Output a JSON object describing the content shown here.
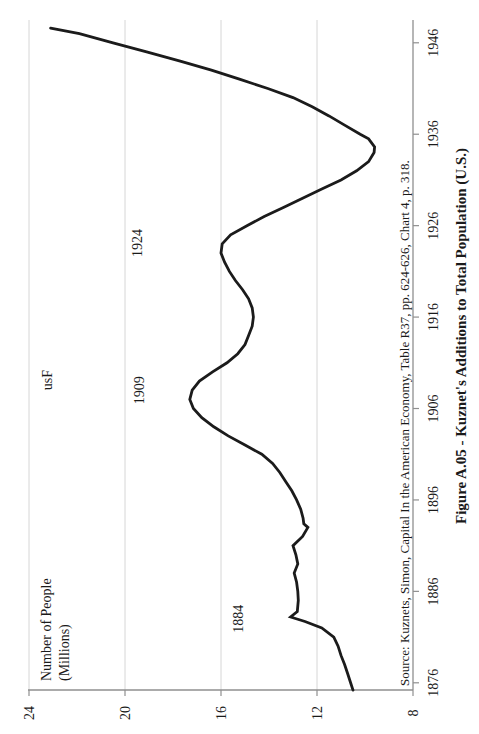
{
  "figure": {
    "title": "Figure A.05 - Kuznet's Additions to Total Population (U.S.)",
    "source": "Source: Kuznets, Simon, Capital In the American Economy, Table R37, pp. 624-626, Chart 4, p. 318.",
    "y_axis_title_line1": "Number of People",
    "y_axis_title_line2": "(Millions)"
  },
  "colors": {
    "line": "#1b1b1b",
    "grid": "#d6d6d6",
    "axis": "#8f8f8f",
    "text": "#1a1a1a",
    "watermark": "#8c8c8c",
    "background": "#ffffff"
  },
  "chart_data": {
    "type": "line",
    "title": "Figure A.05 - Kuznet's Additions to Total Population (U.S.)",
    "xlabel": "",
    "ylabel": "Number of People (Millions)",
    "orientation_note": "landscape chart rotated 90deg CCW to portrait",
    "x_range": [
      1875.2,
      1948.5
    ],
    "ylim": [
      8,
      24
    ],
    "x_ticks": [
      1876,
      1886,
      1896,
      1906,
      1916,
      1926,
      1936,
      1946
    ],
    "y_ticks": [
      8,
      12,
      16,
      20,
      24
    ],
    "gridline_values": [
      12,
      16,
      20,
      24
    ],
    "grid": "horizontal-only",
    "legend": "none",
    "series": [
      {
        "name": "Additions to Total Population",
        "points": [
          [
            1875.2,
            10.5
          ],
          [
            1876,
            10.6
          ],
          [
            1877,
            10.72
          ],
          [
            1878,
            10.85
          ],
          [
            1879,
            11.0
          ],
          [
            1880,
            11.12
          ],
          [
            1881,
            11.3
          ],
          [
            1882,
            11.8
          ],
          [
            1882.7,
            12.5
          ],
          [
            1883.2,
            13.1
          ],
          [
            1883.8,
            12.82
          ],
          [
            1885,
            12.78
          ],
          [
            1886,
            12.8
          ],
          [
            1887,
            12.85
          ],
          [
            1888,
            12.95
          ],
          [
            1889,
            12.8
          ],
          [
            1890,
            12.88
          ],
          [
            1891,
            13.0
          ],
          [
            1892,
            12.6
          ],
          [
            1893,
            12.38
          ],
          [
            1893.4,
            12.55
          ],
          [
            1894,
            12.58
          ],
          [
            1895,
            12.68
          ],
          [
            1896,
            12.85
          ],
          [
            1897,
            13.05
          ],
          [
            1898,
            13.3
          ],
          [
            1899,
            13.55
          ],
          [
            1900,
            13.85
          ],
          [
            1901,
            14.3
          ],
          [
            1902,
            15.0
          ],
          [
            1903,
            15.7
          ],
          [
            1904,
            16.3
          ],
          [
            1905,
            16.8
          ],
          [
            1906,
            17.15
          ],
          [
            1907,
            17.3
          ],
          [
            1908,
            17.2
          ],
          [
            1909,
            16.9
          ],
          [
            1910,
            16.35
          ],
          [
            1911,
            15.75
          ],
          [
            1912,
            15.3
          ],
          [
            1913,
            15.0
          ],
          [
            1914,
            14.85
          ],
          [
            1915,
            14.7
          ],
          [
            1916,
            14.65
          ],
          [
            1917,
            14.7
          ],
          [
            1918,
            14.85
          ],
          [
            1919,
            15.1
          ],
          [
            1920,
            15.4
          ],
          [
            1921,
            15.65
          ],
          [
            1922,
            15.85
          ],
          [
            1923,
            16.0
          ],
          [
            1924,
            15.95
          ],
          [
            1925,
            15.6
          ],
          [
            1926,
            14.9
          ],
          [
            1927,
            14.2
          ],
          [
            1928,
            13.4
          ],
          [
            1929,
            12.6
          ],
          [
            1930,
            11.8
          ],
          [
            1931,
            11.0
          ],
          [
            1932,
            10.35
          ],
          [
            1933,
            9.85
          ],
          [
            1934,
            9.62
          ],
          [
            1934.6,
            9.6
          ],
          [
            1935.5,
            9.85
          ],
          [
            1936,
            10.2
          ],
          [
            1937,
            10.85
          ],
          [
            1938,
            11.5
          ],
          [
            1939,
            12.2
          ],
          [
            1940,
            13.0
          ],
          [
            1941,
            14.05
          ],
          [
            1942,
            15.2
          ],
          [
            1943,
            16.4
          ],
          [
            1944,
            17.7
          ],
          [
            1945,
            19.1
          ],
          [
            1946,
            20.5
          ],
          [
            1947,
            21.9
          ],
          [
            1947.6,
            23.1
          ]
        ]
      }
    ],
    "annotations": [
      {
        "text": "1884",
        "year": 1883.0,
        "value": 15.3,
        "color": "#1a1a1a"
      },
      {
        "text": "1909",
        "year": 1908.0,
        "value": 19.4,
        "color": "#1a1a1a"
      },
      {
        "text": "1924",
        "year": 1924.1,
        "value": 19.5,
        "color": "#1a1a1a"
      },
      {
        "text": "usF",
        "year": 1909.1,
        "value": 23.25,
        "color": "#8c8c8c"
      }
    ]
  }
}
